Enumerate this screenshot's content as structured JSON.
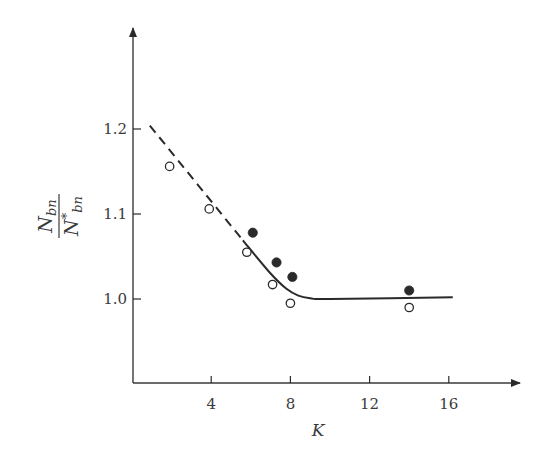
{
  "chart_data": {
    "type": "scatter",
    "title": "",
    "xlabel": "K",
    "ylabel": {
      "numerator": "N",
      "numerator_sub": "bn",
      "denominator": "N",
      "denominator_sup": "*",
      "denominator_sub": "bn",
      "full": "N_bn / N*_bn"
    },
    "xlim": [
      0,
      18
    ],
    "ylim": [
      0.84,
      1.3
    ],
    "x_ticks": [
      4,
      8,
      12,
      16
    ],
    "x_tick_labels": [
      "4",
      "8",
      "12",
      "16"
    ],
    "y_ticks": [
      1.0,
      1.1,
      1.2
    ],
    "y_tick_labels": [
      "1.0",
      "1.1",
      "1.2"
    ],
    "grid": false,
    "legend": null,
    "series": [
      {
        "name": "open circles",
        "marker": "open-circle",
        "points": [
          {
            "x": 1.9,
            "y": 1.156
          },
          {
            "x": 3.9,
            "y": 1.106
          },
          {
            "x": 5.8,
            "y": 1.055
          },
          {
            "x": 7.1,
            "y": 1.017
          },
          {
            "x": 8.0,
            "y": 0.995
          },
          {
            "x": 14.0,
            "y": 0.99
          }
        ]
      },
      {
        "name": "filled circles",
        "marker": "filled-circle",
        "points": [
          {
            "x": 6.1,
            "y": 1.078
          },
          {
            "x": 7.3,
            "y": 1.043
          },
          {
            "x": 8.1,
            "y": 1.026
          },
          {
            "x": 14.0,
            "y": 1.01
          }
        ]
      },
      {
        "name": "extrapolated trend",
        "type": "line",
        "style": "dashed",
        "points": [
          {
            "x": 0.9,
            "y": 1.204
          },
          {
            "x": 5.6,
            "y": 1.069
          }
        ]
      },
      {
        "name": "fitted curve",
        "type": "line",
        "style": "solid",
        "points": [
          {
            "x": 5.6,
            "y": 1.069
          },
          {
            "x": 7.0,
            "y": 1.03
          },
          {
            "x": 7.8,
            "y": 1.012
          },
          {
            "x": 8.4,
            "y": 1.004
          },
          {
            "x": 9.0,
            "y": 1.001
          },
          {
            "x": 10.0,
            "y": 1.0
          },
          {
            "x": 16.2,
            "y": 1.002
          }
        ]
      }
    ]
  },
  "colors": {
    "ink": "#2a2a2a",
    "background": "#ffffff"
  }
}
